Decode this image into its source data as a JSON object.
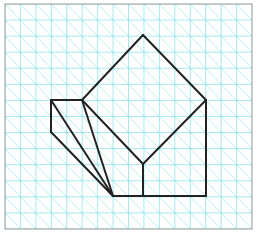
{
  "diagram": {
    "title": "",
    "kind": "isometric-grid-drawing",
    "colors": {
      "background": "#ffffff",
      "grid": "#7fdfe6",
      "grid_diagonal": "#a8e8ec",
      "border": "#9a9a9a",
      "shape_stroke": "#222222"
    },
    "grid": {
      "origin_x": 5,
      "origin_y": 4,
      "cols": 16,
      "rows": 14,
      "cell_w": 15.44,
      "cell_h": 16.07
    },
    "vertices": {
      "A": [
        51,
        100
      ],
      "B": [
        82,
        100
      ],
      "C": [
        51,
        132
      ],
      "D": [
        113,
        196
      ],
      "E": [
        143,
        35
      ],
      "F": [
        206,
        100
      ],
      "G": [
        143,
        164
      ],
      "H": [
        143,
        196
      ],
      "I": [
        206,
        196
      ]
    },
    "edges": [
      [
        "A",
        "B"
      ],
      [
        "A",
        "C"
      ],
      [
        "A",
        "D"
      ],
      [
        "C",
        "D"
      ],
      [
        "B",
        "D"
      ],
      [
        "B",
        "G"
      ],
      [
        "B",
        "E"
      ],
      [
        "E",
        "F"
      ],
      [
        "F",
        "G"
      ],
      [
        "G",
        "H"
      ],
      [
        "D",
        "H"
      ],
      [
        "H",
        "I"
      ],
      [
        "F",
        "I"
      ]
    ]
  }
}
